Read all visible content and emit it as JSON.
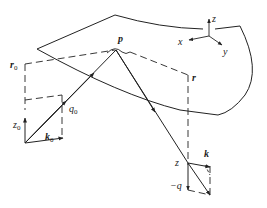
{
  "diagram": {
    "type": "scattering-geometry",
    "labels": {
      "p": "p",
      "r0": "r",
      "r0_sub": "0",
      "r": "r",
      "q0": "q",
      "q0_sub": "0",
      "z0": "z",
      "z0_sub": "0",
      "k0": "k",
      "k0_sub": "0",
      "z": "z",
      "k": "k",
      "minus_q": "−q",
      "axis_x": "x",
      "axis_y": "y",
      "axis_z": "z"
    },
    "colors": {
      "line": "#222222",
      "background": "#ffffff"
    }
  }
}
